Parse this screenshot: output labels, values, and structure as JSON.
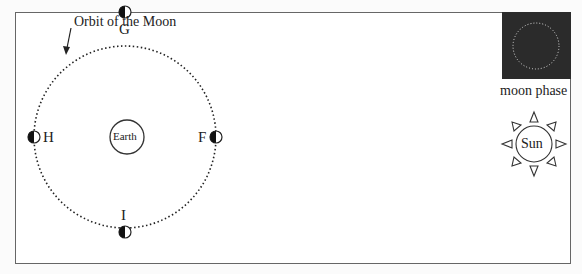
{
  "diagram": {
    "orbit_label": "Orbit of the Moon",
    "center_body": "Earth",
    "sun_label": "Sun",
    "moon_phase_label": "moon phase",
    "positions": [
      {
        "id": "G",
        "label": "G",
        "location": "top"
      },
      {
        "id": "H",
        "label": "H",
        "location": "left"
      },
      {
        "id": "F",
        "label": "F",
        "location": "right"
      },
      {
        "id": "I",
        "label": "I",
        "location": "bottom"
      }
    ],
    "colors": {
      "moon_phase_box": "#2b2b2b",
      "line": "#222222"
    }
  }
}
